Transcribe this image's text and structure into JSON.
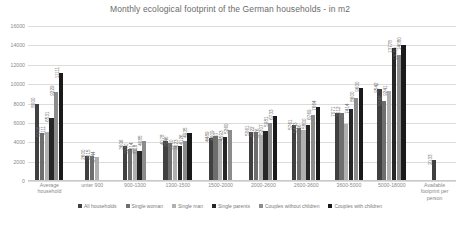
{
  "chart_data": {
    "type": "bar",
    "title": "Monthly ecological footprint of the German households - in m2",
    "xlabel": "",
    "ylabel": "",
    "ylim": [
      0,
      16000
    ],
    "ytick_step": 2000,
    "yticks": [
      "0",
      "2000",
      "4000",
      "6000",
      "8000",
      "10000",
      "12000",
      "14000",
      "16000"
    ],
    "grid": true,
    "legend_position": "bottom",
    "categories": [
      "Average household",
      "unter 900",
      "900-1300",
      "1300-1500",
      "1500-2000",
      "2000-2600",
      "2600-3600",
      "3600-5000",
      "5000-18000",
      "Available footprint per person"
    ],
    "series": [
      {
        "name": "All households",
        "color": "#404040",
        "values": [
          8000,
          2600,
          3606,
          4178,
          4489,
          5061,
          5761,
          7071,
          9542,
          2133
        ]
      },
      {
        "name": "Single woman",
        "color": "#6e6e6e",
        "values": [
          5006,
          2615,
          3280,
          3946,
          4609,
          5022,
          5443,
          7012,
          8243,
          null
        ]
      },
      {
        "name": "Single man",
        "color": "#b0b0b0",
        "values": [
          5111,
          2444,
          3314,
          3610,
          4357,
          4776,
          5256,
          5904,
          9241,
          null
        ]
      },
      {
        "name": "Single parents",
        "color": "#262626",
        "values": [
          6531,
          null,
          3118,
          3623,
          4593,
          5207,
          5800,
          7414,
          13778,
          null
        ]
      },
      {
        "name": "Couples without children",
        "color": "#8c8c8c",
        "values": [
          9229,
          null,
          4085,
          4126,
          5260,
          5981,
          6769,
          8600,
          13050,
          null
        ]
      },
      {
        "name": "Couples with children",
        "color": "#1a1a1a",
        "values": [
          11111,
          null,
          null,
          4935,
          null,
          6733,
          7664,
          9600,
          14080,
          null
        ]
      }
    ]
  },
  "legend": {
    "items": [
      "All households",
      "Single woman",
      "Single man",
      "Single parents",
      "Couples without children",
      "Couples with children"
    ]
  }
}
